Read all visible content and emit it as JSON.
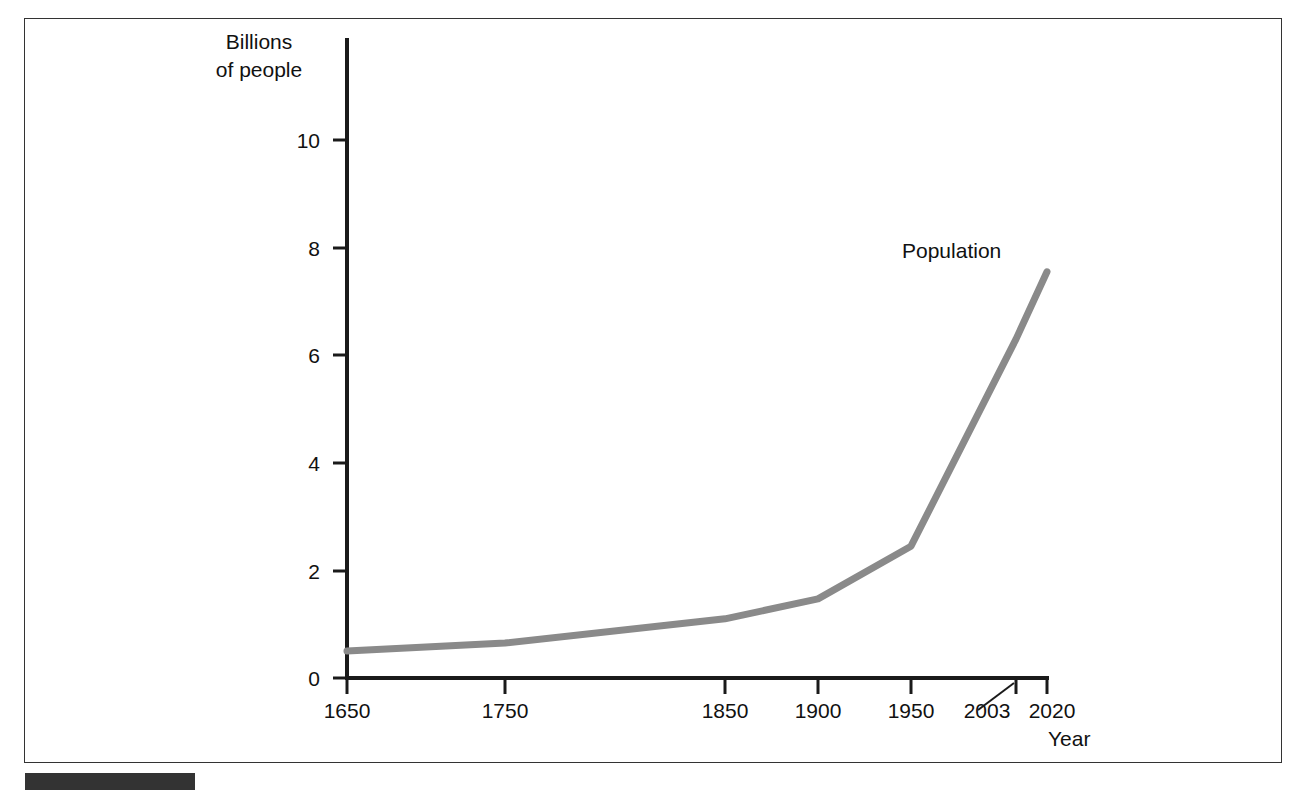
{
  "figure": {
    "frame_color": "#333333",
    "background_color": "#ffffff",
    "bottom_bar_color": "#333333"
  },
  "chart_data": {
    "type": "line",
    "title": "",
    "xlabel": "Year",
    "ylabel": "Billions of people",
    "ylabel_line1": "Billions",
    "ylabel_line2": "of people",
    "series_annotation": "Population",
    "categories": [
      "1650",
      "1750",
      "1850",
      "1900",
      "1950",
      "2003",
      "2020"
    ],
    "x": [
      1650,
      1750,
      1850,
      1900,
      1950,
      2003,
      2020
    ],
    "values": [
      0.5,
      0.65,
      1.1,
      1.47,
      2.45,
      6.3,
      7.55
    ],
    "series": [
      {
        "name": "Population",
        "values": [
          0.5,
          0.65,
          1.1,
          1.47,
          2.45,
          6.3,
          7.55
        ],
        "color": "#8a8a8a"
      }
    ],
    "xtick_labels": [
      "1650",
      "1750",
      "1850",
      "1900",
      "1950",
      "2003",
      "2020"
    ],
    "ytick_labels": [
      "0",
      "2",
      "4",
      "6",
      "8",
      "10"
    ],
    "ytick_values": [
      0,
      2,
      4,
      6,
      8,
      10
    ],
    "ylim": [
      0,
      11.9
    ],
    "xlim": [
      1650,
      2020
    ],
    "grid": false,
    "legend": "none",
    "line_color": "#8a8a8a",
    "axis_color": "#1a1a1a",
    "annotations": [
      {
        "text": "2003",
        "note": "label offset left of its tick, connected by a diagonal leader line"
      }
    ]
  },
  "axis": {
    "y_ticks": [
      {
        "label": "10",
        "value": 10
      },
      {
        "label": "8",
        "value": 8
      },
      {
        "label": "6",
        "value": 6
      },
      {
        "label": "4",
        "value": 4
      },
      {
        "label": "2",
        "value": 2
      },
      {
        "label": "0",
        "value": 0
      }
    ],
    "x_ticks": [
      {
        "label": "1650",
        "value": 1650
      },
      {
        "label": "1750",
        "value": 1750
      },
      {
        "label": "1850",
        "value": 1850
      },
      {
        "label": "1900",
        "value": 1900
      },
      {
        "label": "1950",
        "value": 1950
      },
      {
        "label": "2003",
        "value": 2003
      },
      {
        "label": "2020",
        "value": 2020
      }
    ]
  }
}
